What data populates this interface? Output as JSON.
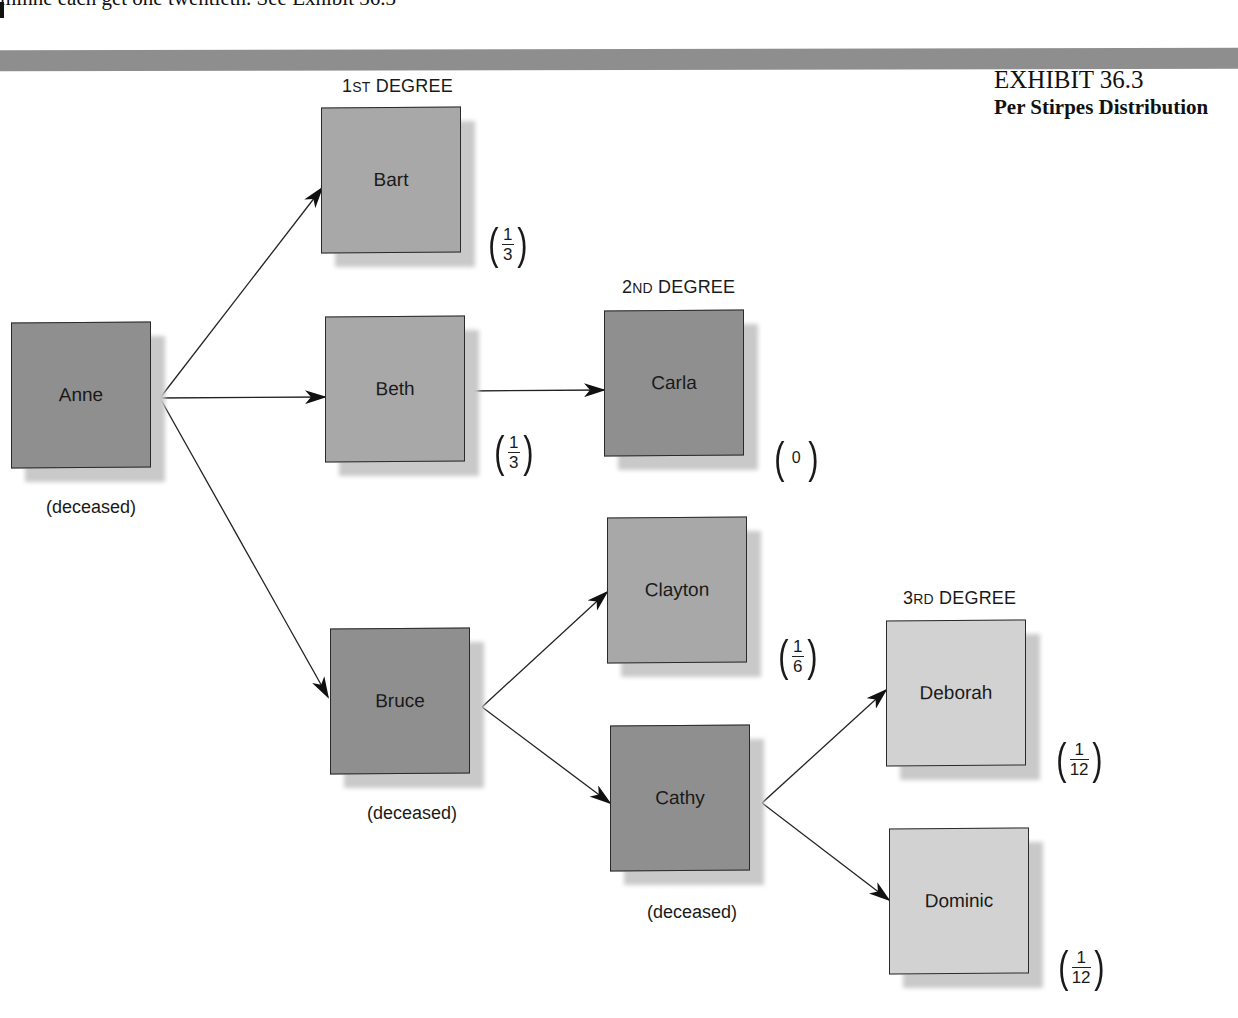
{
  "page": {
    "top_text": "minne each get one twentieth. See Exhibit 36.3"
  },
  "exhibit": {
    "number": "EXHIBIT 36.3",
    "title": "Per Stirpes Distribution"
  },
  "degrees": {
    "first": {
      "num": "1",
      "suffix": "ST",
      "word": " DEGREE"
    },
    "second": {
      "num": "2",
      "suffix": "ND",
      "word": " DEGREE"
    },
    "third": {
      "num": "3",
      "suffix": "RD",
      "word": " DEGREE"
    }
  },
  "status_label": "(deceased)",
  "nodes": {
    "anne": {
      "name": "Anne",
      "status": "(deceased)"
    },
    "bart": {
      "name": "Bart",
      "share_num": "1",
      "share_den": "3"
    },
    "beth": {
      "name": "Beth",
      "share_num": "1",
      "share_den": "3"
    },
    "bruce": {
      "name": "Bruce",
      "status": "(deceased)"
    },
    "carla": {
      "name": "Carla",
      "share": "0"
    },
    "clayton": {
      "name": "Clayton",
      "share_num": "1",
      "share_den": "6"
    },
    "cathy": {
      "name": "Cathy",
      "status": "(deceased)"
    },
    "deborah": {
      "name": "Deborah",
      "share_num": "1",
      "share_den": "12"
    },
    "dominic": {
      "name": "Dominic",
      "share_num": "1",
      "share_den": "12"
    }
  },
  "edges": [
    [
      "Anne",
      "Bart"
    ],
    [
      "Anne",
      "Beth"
    ],
    [
      "Anne",
      "Bruce"
    ],
    [
      "Beth",
      "Carla"
    ],
    [
      "Bruce",
      "Clayton"
    ],
    [
      "Bruce",
      "Cathy"
    ],
    [
      "Cathy",
      "Deborah"
    ],
    [
      "Cathy",
      "Dominic"
    ]
  ],
  "colors": {
    "deceased_or_generation_box": "#8f8f8f",
    "first_degree_box": "#a8a8a8",
    "third_degree_box": "#d2d2d2",
    "shadow": "#c9c9c9",
    "band": "#8e8e8e"
  }
}
